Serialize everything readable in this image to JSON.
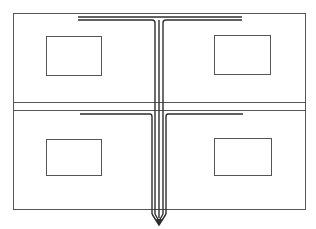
{
  "diagram": {
    "type": "line-drawing",
    "stroke_color": "#3a3a3a",
    "background": "#ffffff",
    "outer_frame": {
      "x": 13,
      "y": 13,
      "w": 292,
      "h": 196
    },
    "divider_lines": [
      102,
      110
    ],
    "panels": [
      {
        "name": "top-left",
        "window": {
          "x": 46,
          "y": 36,
          "w": 55,
          "h": 39
        }
      },
      {
        "name": "top-right",
        "window": {
          "x": 214,
          "y": 35,
          "w": 56,
          "h": 39
        }
      },
      {
        "name": "bottom-left",
        "window": {
          "x": 46,
          "y": 139,
          "w": 55,
          "h": 36
        }
      },
      {
        "name": "bottom-right",
        "window": {
          "x": 214,
          "y": 138,
          "w": 57,
          "h": 37
        }
      }
    ],
    "upper_tee": {
      "bar_y": 17,
      "bar_x1": 78,
      "bar_x2": 242
    },
    "lower_tee": {
      "bar_y": 114,
      "bar_x1": 80,
      "bar_x2": 243
    },
    "stem": {
      "x_left": 154,
      "x_right": 163,
      "y_top": 17,
      "y_tip": 225
    }
  }
}
